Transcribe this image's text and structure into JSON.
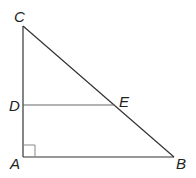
{
  "diagram": {
    "type": "geometry-triangle",
    "points": {
      "C": {
        "label": "C",
        "x": 23,
        "y": 26
      },
      "D": {
        "label": "D",
        "x": 23,
        "y": 105
      },
      "A": {
        "label": "A",
        "x": 23,
        "y": 157
      },
      "B": {
        "label": "B",
        "x": 174,
        "y": 157
      },
      "E": {
        "label": "E",
        "x": 115,
        "y": 105
      }
    },
    "segments": [
      "CA",
      "AB",
      "BC",
      "DE"
    ],
    "right_angle_at": "A",
    "line_color": "#333333",
    "de_color": "#555555"
  }
}
